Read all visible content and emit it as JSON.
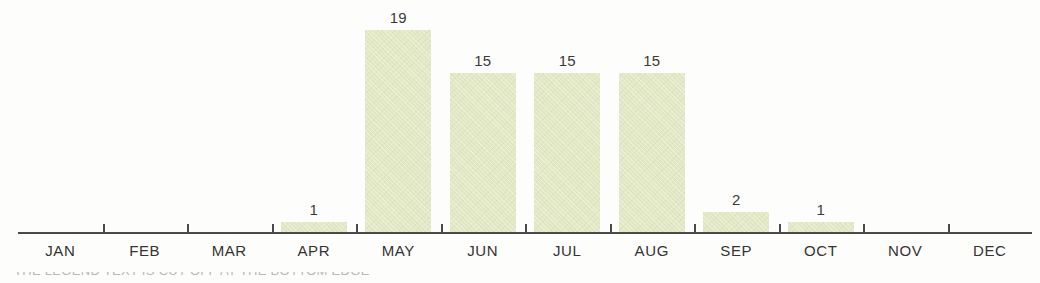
{
  "chart_data": {
    "type": "bar",
    "title": "",
    "subtitle": "",
    "xlabel": "",
    "ylabel": "",
    "categories": [
      "JAN",
      "FEB",
      "MAR",
      "APR",
      "MAY",
      "JUN",
      "JUL",
      "AUG",
      "SEP",
      "OCT",
      "NOV",
      "DEC"
    ],
    "values": [
      0,
      0,
      0,
      1,
      19,
      15,
      15,
      15,
      2,
      1,
      0,
      0
    ],
    "value_labels": [
      "",
      "",
      "",
      "1",
      "19",
      "15",
      "15",
      "15",
      "2",
      "1",
      "",
      ""
    ],
    "ylim": [
      0,
      19
    ],
    "grid": false,
    "legend": null,
    "axis": {
      "show_x_axis_line": true,
      "show_y_axis_line": false,
      "tick_count": 11
    },
    "annotations": []
  },
  "style": {
    "bar_color": "#e2e8c4",
    "axis_color": "#4a4a48",
    "label_color": "#343434",
    "value_color": "#3b3b3b",
    "background": "#fdfdfb"
  },
  "caption": {
    "clipped_text": "THE LEGEND TEXT IS CUT OFF AT THE BOTTOM EDGE"
  }
}
